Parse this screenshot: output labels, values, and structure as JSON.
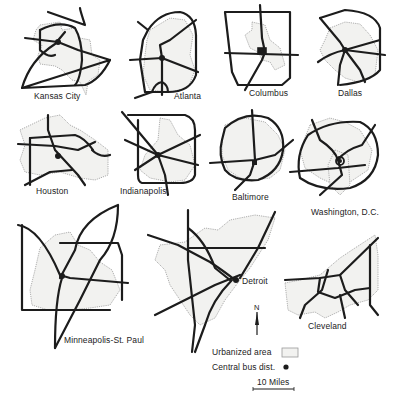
{
  "figure": {
    "type": "diagram"
  },
  "cities": [
    {
      "name": "Kansas City"
    },
    {
      "name": "Atlanta"
    },
    {
      "name": "Columbus"
    },
    {
      "name": "Dallas"
    },
    {
      "name": "Houston"
    },
    {
      "name": "Indianapolis"
    },
    {
      "name": "Baltimore"
    },
    {
      "name": "Washington, D.C."
    },
    {
      "name": "Minneapolis-St. Paul"
    },
    {
      "name": "Detroit"
    },
    {
      "name": "Cleveland"
    }
  ],
  "legend": {
    "north_label": "N",
    "urbanized_area": "Urbanized area",
    "central_business_district": "Central bus dist.",
    "scale_label": "10 Miles"
  },
  "colors": {
    "highway": "#1c1c1c",
    "urbanized_fill": "#f2f2f0",
    "urbanized_outline": "#9a9a9a"
  }
}
